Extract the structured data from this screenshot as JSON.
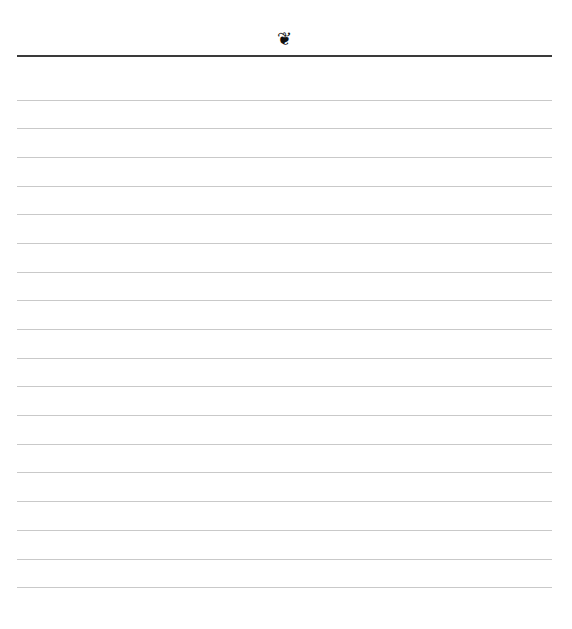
{
  "page": {
    "type": "lined-notepaper",
    "ornament": {
      "icon": "fleuron-icon",
      "glyph": "❦"
    },
    "header_rule_color": "#3a3a3a",
    "line_color": "#c9c9c9",
    "line_count": 18,
    "lines_y": [
      100,
      128,
      157,
      186,
      214,
      243,
      272,
      300,
      329,
      358,
      386,
      415,
      444,
      472,
      501,
      530,
      559,
      587
    ]
  }
}
